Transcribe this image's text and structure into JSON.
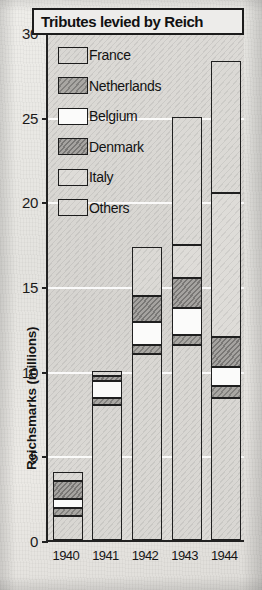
{
  "chart_data": {
    "type": "bar",
    "title": "Tributes levied by Reich",
    "xlabel": "",
    "ylabel": "Reichsmarks (millions)",
    "categories": [
      "1940",
      "1941",
      "1942",
      "1943",
      "1944"
    ],
    "ylim": [
      0,
      30
    ],
    "yticks": [
      0,
      5,
      10,
      15,
      20,
      25,
      30
    ],
    "grid": true,
    "stacked": true,
    "legend_position": "upper-left-inside",
    "series": [
      {
        "name": "France",
        "color": "#d9d7d3",
        "values": [
          1.4,
          8.0,
          11.0,
          11.5,
          8.4
        ]
      },
      {
        "name": "Netherlands",
        "color": "#a9a7a3",
        "values": [
          0.5,
          0.4,
          0.5,
          0.6,
          0.7
        ]
      },
      {
        "name": "Belgium",
        "color": "#fbfbfa",
        "values": [
          0.5,
          1.0,
          1.4,
          1.6,
          1.1
        ]
      },
      {
        "name": "Denmark",
        "color": "#a5a3a0",
        "values": [
          1.1,
          0.3,
          1.5,
          1.8,
          1.8
        ]
      },
      {
        "name": "Italy",
        "color": "#dedcd8",
        "values": [
          0.0,
          0.0,
          0.0,
          1.9,
          8.5
        ]
      },
      {
        "name": "Others",
        "color": "#dbd9d5",
        "values": [
          0.5,
          0.3,
          2.9,
          7.6,
          7.8
        ]
      }
    ],
    "totals": [
      4.0,
      10.0,
      17.3,
      25.0,
      28.3
    ]
  },
  "legend": {
    "items": [
      {
        "label": "France",
        "swatch": "france-swatch"
      },
      {
        "label": "Netherlands",
        "swatch": "netherlands-swatch"
      },
      {
        "label": "Belgium",
        "swatch": "belgium-swatch"
      },
      {
        "label": "Denmark",
        "swatch": "denmark-swatch"
      },
      {
        "label": "Italy",
        "swatch": "italy-swatch"
      },
      {
        "label": "Others",
        "swatch": "others-swatch"
      }
    ]
  },
  "yticklabels": [
    "30",
    "25",
    "20",
    "15",
    "10",
    "5",
    "0"
  ]
}
